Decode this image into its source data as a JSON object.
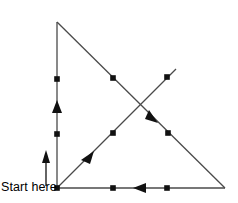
{
  "figure": {
    "label_start": "Start here",
    "colors": {
      "line": "#4a4a4a",
      "marker": "#111111",
      "arrow": "#111111",
      "background": "#ffffff",
      "text": "#000000"
    },
    "vertices": {
      "origin": [
        57,
        188
      ],
      "top": [
        57,
        22
      ],
      "bottom_right": [
        225,
        188
      ],
      "ray_tip": [
        176,
        69
      ]
    },
    "segments": [
      {
        "name": "vertical-left-edge",
        "from": [
          57,
          188
        ],
        "to": [
          57,
          22
        ],
        "direction": "up",
        "dots": [
          [
            57,
            79
          ],
          [
            57,
            134
          ]
        ],
        "arrow_at": [
          57,
          107
        ],
        "arrow_angle_deg": -90
      },
      {
        "name": "bottom-edge",
        "from": [
          225,
          188
        ],
        "to": [
          57,
          188
        ],
        "direction": "left",
        "dots": [
          [
            113,
            188
          ],
          [
            167,
            188
          ]
        ],
        "arrow_at": [
          138,
          188
        ],
        "arrow_angle_deg": 180
      },
      {
        "name": "hypotenuse",
        "from": [
          57,
          22
        ],
        "to": [
          225,
          188
        ],
        "direction": "down-right",
        "dots": [
          [
            113,
            78
          ],
          [
            168,
            133
          ]
        ],
        "arrow_at": [
          152,
          117
        ],
        "arrow_angle_deg": 45
      },
      {
        "name": "ascending-ray",
        "from": [
          57,
          188
        ],
        "to": [
          176,
          69
        ],
        "direction": "up-right",
        "dots": [
          [
            113,
            133
          ],
          [
            167,
            77
          ]
        ],
        "arrow_at": [
          88,
          157
        ],
        "arrow_angle_deg": -45
      }
    ],
    "pointer_arrow": {
      "name": "start-pointer",
      "from": [
        46,
        186
      ],
      "to": [
        46,
        152
      ],
      "direction": "up"
    }
  }
}
